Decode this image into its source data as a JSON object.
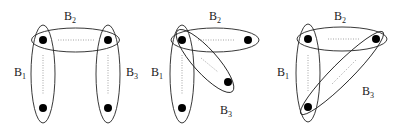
{
  "diagram": {
    "type": "hypergraph",
    "colors": {
      "stroke": "#222222",
      "node": "#000000",
      "dotted": "#9a9a9a",
      "background": "#ffffff"
    },
    "panels": [
      {
        "id": "panel-1",
        "labels": [
          {
            "name": "B",
            "sub": "2",
            "x": 64,
            "y": 10
          },
          {
            "name": "B",
            "sub": "1",
            "x": 14,
            "y": 66
          },
          {
            "name": "B",
            "sub": "3",
            "x": 126,
            "y": 66
          }
        ]
      },
      {
        "id": "panel-2",
        "labels": [
          {
            "name": "B",
            "sub": "2",
            "x": 209,
            "y": 10
          },
          {
            "name": "B",
            "sub": "1",
            "x": 151,
            "y": 66
          },
          {
            "name": "B",
            "sub": "3",
            "x": 220,
            "y": 104
          }
        ]
      },
      {
        "id": "panel-3",
        "labels": [
          {
            "name": "B",
            "sub": "2",
            "x": 334,
            "y": 10
          },
          {
            "name": "B",
            "sub": "1",
            "x": 277,
            "y": 66
          },
          {
            "name": "B",
            "sub": "3",
            "x": 362,
            "y": 85
          }
        ]
      }
    ]
  }
}
